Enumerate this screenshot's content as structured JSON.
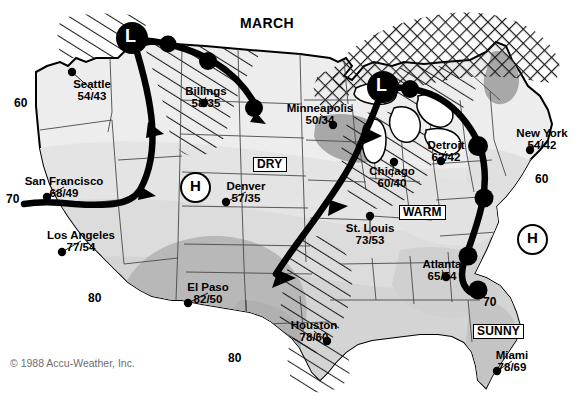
{
  "title": "MARCH",
  "copyright": "© 1988 Accu-Weather, Inc.",
  "colors": {
    "ink": "#000000",
    "land_light": "#ededed",
    "land_mid": "#dcdcdc",
    "land_dark": "#b8b8b8",
    "land_darker": "#a3a3a3",
    "background": "#ffffff",
    "copyright_gray": "#6e6e6e"
  },
  "cities": [
    {
      "name": "Seattle",
      "temps": "54/43",
      "label_x": 92,
      "label_y": 79,
      "dot_x": 72,
      "dot_y": 72
    },
    {
      "name": "Billings",
      "temps": "58/35",
      "label_x": 206,
      "label_y": 86,
      "dot_x": 204,
      "dot_y": 103
    },
    {
      "name": "Minneapolis",
      "temps": "50/34",
      "label_x": 320,
      "label_y": 103,
      "dot_x": 333,
      "dot_y": 125
    },
    {
      "name": "Detroit",
      "temps": "62/42",
      "label_x": 446,
      "label_y": 140,
      "dot_x": 441,
      "dot_y": 161
    },
    {
      "name": "New York",
      "temps": "54/42",
      "label_x": 542,
      "label_y": 128,
      "dot_x": 530,
      "dot_y": 150
    },
    {
      "name": "Chicago",
      "temps": "60/40",
      "label_x": 392,
      "label_y": 166,
      "dot_x": 394,
      "dot_y": 162
    },
    {
      "name": "San Francisco",
      "temps": "68/49",
      "label_x": 64,
      "label_y": 176,
      "dot_x": 47,
      "dot_y": 197
    },
    {
      "name": "Denver",
      "temps": "57/35",
      "label_x": 246,
      "label_y": 181,
      "dot_x": 226,
      "dot_y": 202
    },
    {
      "name": "St. Louis",
      "temps": "73/53",
      "label_x": 370,
      "label_y": 223,
      "dot_x": 370,
      "dot_y": 216
    },
    {
      "name": "Los Angeles",
      "temps": "77/54",
      "label_x": 81,
      "label_y": 230,
      "dot_x": 62,
      "dot_y": 252
    },
    {
      "name": "Atlanta",
      "temps": "65/54",
      "label_x": 442,
      "label_y": 259,
      "dot_x": 446,
      "dot_y": 277
    },
    {
      "name": "El Paso",
      "temps": "82/50",
      "label_x": 208,
      "label_y": 282,
      "dot_x": 188,
      "dot_y": 303
    },
    {
      "name": "Houston",
      "temps": "78/60",
      "label_x": 314,
      "label_y": 320,
      "dot_x": 327,
      "dot_y": 341
    },
    {
      "name": "Miami",
      "temps": "78/69",
      "label_x": 512,
      "label_y": 350,
      "dot_x": 497,
      "dot_y": 371
    }
  ],
  "isotherms": [
    {
      "value": "60",
      "x": 16,
      "y": 97
    },
    {
      "value": "70",
      "x": 8,
      "y": 196
    },
    {
      "value": "80",
      "x": 90,
      "y": 294
    },
    {
      "value": "80",
      "x": 230,
      "y": 354
    },
    {
      "value": "60",
      "x": 537,
      "y": 175
    },
    {
      "value": "70",
      "x": 485,
      "y": 298
    }
  ],
  "condition_labels": [
    {
      "text": "DRY",
      "x": 253,
      "y": 157
    },
    {
      "text": "WARM",
      "x": 399,
      "y": 205
    },
    {
      "text": "SUNNY",
      "x": 475,
      "y": 324
    }
  ],
  "pressure_systems": [
    {
      "type": "L",
      "x": 132,
      "y": 38,
      "label": "L"
    },
    {
      "type": "L",
      "x": 383,
      "y": 87,
      "label": "L"
    },
    {
      "type": "H",
      "x": 193,
      "y": 185,
      "label": "H"
    },
    {
      "type": "H",
      "x": 530,
      "y": 237,
      "label": "H"
    }
  ],
  "legend_notes": {
    "front_types": [
      "occluded",
      "cold",
      "warm"
    ],
    "hatch_precip": "rain-hatch",
    "crosshatch_precip": "snow-crosshatch"
  }
}
